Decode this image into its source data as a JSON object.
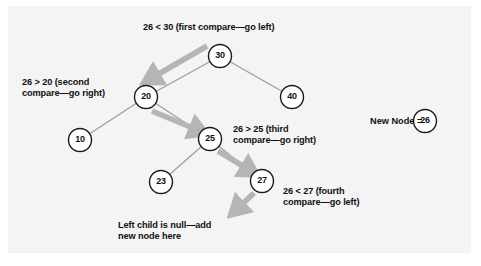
{
  "figure": {
    "kind": "binary-search-tree-insertion-diagram",
    "background": "#f4f4f4",
    "page_background": "#ffffff",
    "node_fill": "#ffffff",
    "node_stroke": "#1a1a1a",
    "edge_color": "#9a9a9a",
    "arrow_color": "#b3b3b3",
    "text_color": "#111111"
  },
  "tree": {
    "nodes": [
      {
        "id": "n30",
        "value": "30",
        "cx": 220,
        "cy": 56,
        "r": 11.5
      },
      {
        "id": "n20",
        "value": "20",
        "cx": 146,
        "cy": 97,
        "r": 11.5
      },
      {
        "id": "n40",
        "value": "40",
        "cx": 292,
        "cy": 97,
        "r": 11.5
      },
      {
        "id": "n10",
        "value": "10",
        "cx": 80,
        "cy": 140,
        "r": 11.5
      },
      {
        "id": "n25",
        "value": "25",
        "cx": 210,
        "cy": 139,
        "r": 11.5
      },
      {
        "id": "n23",
        "value": "23",
        "cx": 161,
        "cy": 182,
        "r": 11.5
      },
      {
        "id": "n27",
        "value": "27",
        "cx": 262,
        "cy": 181,
        "r": 11.5
      }
    ],
    "edges": [
      {
        "from": "n30",
        "to": "n20"
      },
      {
        "from": "n30",
        "to": "n40"
      },
      {
        "from": "n20",
        "to": "n10"
      },
      {
        "from": "n20",
        "to": "n25"
      },
      {
        "from": "n25",
        "to": "n23"
      },
      {
        "from": "n25",
        "to": "n27"
      }
    ]
  },
  "arrows": [
    {
      "id": "arrow-first-compare",
      "x1": 206,
      "y1": 46,
      "x2": 146,
      "y2": 82
    },
    {
      "id": "arrow-second-compare",
      "x1": 155,
      "y1": 110,
      "x2": 205,
      "y2": 132
    },
    {
      "id": "arrow-third-compare",
      "x1": 218,
      "y1": 150,
      "x2": 255,
      "y2": 173
    },
    {
      "id": "arrow-fourth-compare",
      "x1": 253,
      "y1": 192,
      "x2": 233,
      "y2": 213
    }
  ],
  "labels": {
    "first_compare": "26 < 30 (first compare—go left)",
    "second_compare": "26 > 20 (second\ncompare—go right)",
    "third_compare": "26 > 25 (third\ncompare—go right)",
    "fourth_compare": "26 < 27 (fourth\ncompare—go left)",
    "null_child": "Left child is null—add\nnew node here",
    "new_node_prefix": "New Node ="
  },
  "new_node": {
    "value": "26",
    "cx": 425,
    "cy": 121,
    "r": 11.5
  }
}
